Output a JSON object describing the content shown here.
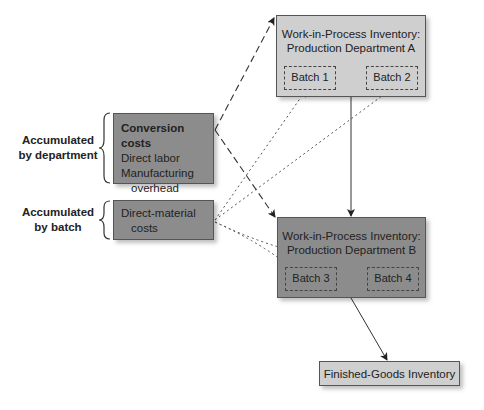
{
  "nodes": {
    "wip_a": {
      "title_line1": "Work-in-Process Inventory:",
      "title_line2": "Production Department A",
      "batches": [
        "Batch 1",
        "Batch 2"
      ],
      "fill": "#cfcfcf"
    },
    "wip_b": {
      "title_line1": "Work-in-Process Inventory:",
      "title_line2": "Production Department B",
      "batches": [
        "Batch 3",
        "Batch 4"
      ],
      "fill": "#8c8c8c"
    },
    "finished_goods": {
      "title": "Finished-Goods Inventory",
      "fill": "#cfcfcf"
    },
    "conversion_costs": {
      "heading": "Conversion costs",
      "line1": "Direct labor",
      "line2": "Manufacturing",
      "line3": "overhead",
      "fill": "#8c8c8c"
    },
    "direct_material": {
      "line1": "Direct-material",
      "line2": "costs",
      "fill": "#8c8c8c"
    }
  },
  "labels": {
    "by_department": {
      "line1": "Accumulated",
      "line2": "by department"
    },
    "by_batch": {
      "line1": "Accumulated",
      "line2": "by batch"
    }
  },
  "edges": [
    {
      "from": "conversion_costs",
      "to": "wip_a",
      "style": "long-dash"
    },
    {
      "from": "conversion_costs",
      "to": "wip_b",
      "style": "long-dash"
    },
    {
      "from": "direct_material",
      "to": "batch_1",
      "style": "dotted"
    },
    {
      "from": "direct_material",
      "to": "batch_2",
      "style": "dotted"
    },
    {
      "from": "direct_material",
      "to": "batch_3",
      "style": "dotted"
    },
    {
      "from": "direct_material",
      "to": "batch_4",
      "style": "dotted"
    },
    {
      "from": "wip_a",
      "to": "wip_b",
      "style": "solid"
    },
    {
      "from": "wip_b",
      "to": "finished_goods",
      "style": "solid"
    }
  ]
}
